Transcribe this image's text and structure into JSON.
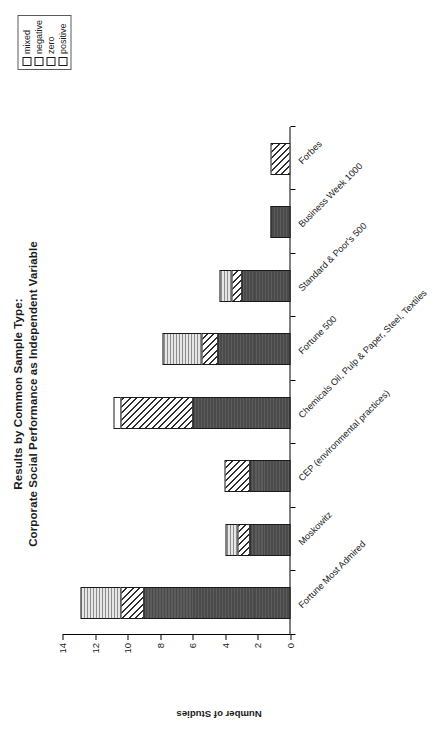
{
  "chart_data": {
    "type": "bar",
    "title": "Results by Common Sample Type:",
    "subtitle": "Corporate Social Performance as Independent Variable",
    "xlabel": "",
    "ylabel": "Number of Studies",
    "ylim": [
      0,
      14
    ],
    "ytick_step": 2,
    "yticks": [
      "0",
      "2",
      "4",
      "6",
      "8",
      "10",
      "12",
      "14"
    ],
    "grid": false,
    "stacked": true,
    "orientation": "vertical",
    "legend_position": "top-right",
    "categories": [
      "Fortune Most Admired",
      "Moskowitz",
      "CEP (environmental practices)",
      "Chemicals Oil, Pulp & Paper, Steel, Textiles",
      "Fortune 500",
      "Standard & Poor's 500",
      "Business Week 1000",
      "Forbes"
    ],
    "series": [
      {
        "name": "positive",
        "values": [
          9.0,
          2.5,
          2.5,
          6.0,
          4.5,
          3.0,
          1.2,
          0.0
        ]
      },
      {
        "name": "zero",
        "values": [
          1.5,
          0.8,
          1.6,
          4.5,
          1.0,
          0.7,
          0.0,
          1.2
        ]
      },
      {
        "name": "negative",
        "values": [
          0.0,
          0.0,
          0.0,
          0.5,
          0.0,
          0.0,
          0.0,
          0.0
        ]
      },
      {
        "name": "mixed",
        "values": [
          2.5,
          0.8,
          0.0,
          0.0,
          2.5,
          0.8,
          0.0,
          0.0
        ]
      }
    ],
    "totals": [
      13.0,
      4.1,
      4.1,
      11.0,
      8.0,
      4.5,
      1.2,
      1.2
    ]
  },
  "legend": {
    "items": [
      {
        "label": "mixed",
        "pattern": "dotted-light-gray",
        "color": "#d9d9d9"
      },
      {
        "label": "negative",
        "pattern": "empty-white",
        "color": "#ffffff"
      },
      {
        "label": "zero",
        "pattern": "diagonal-hatch",
        "color": "#2e2e2e"
      },
      {
        "label": "positive",
        "pattern": "solid-dark",
        "color": "#4a4a4a"
      }
    ]
  }
}
